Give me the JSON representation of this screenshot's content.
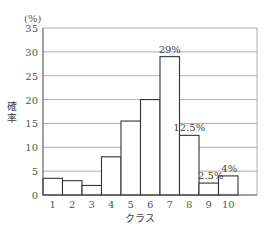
{
  "chart_data": {
    "type": "bar",
    "title": "",
    "xlabel": "クラス",
    "ylabel": "確率",
    "y_unit": "(%)",
    "ylim": [
      0,
      35
    ],
    "yticks": [
      0,
      5,
      10,
      15,
      20,
      25,
      30,
      35
    ],
    "grid": true,
    "legend": null,
    "categories": [
      "1",
      "2",
      "3",
      "4",
      "5",
      "6",
      "7",
      "8",
      "9",
      "10"
    ],
    "values": [
      3.5,
      3,
      2,
      8,
      15.5,
      20,
      29,
      12.5,
      2.5,
      4
    ],
    "annotations": [
      {
        "category": "7",
        "text": "29%"
      },
      {
        "category": "8",
        "text": "12.5%"
      },
      {
        "category": "9",
        "text": "2.5%"
      },
      {
        "category": "10",
        "text": "4%"
      }
    ],
    "colors": {
      "bar_fill": "#ffffff",
      "bar_edge": "#333333",
      "grid": "#999999"
    }
  }
}
